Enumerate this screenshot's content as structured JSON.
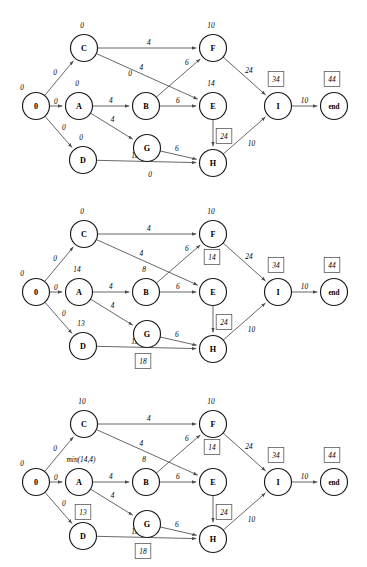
{
  "figure": {
    "kind": "graph-diagram-sequence",
    "panel_count": 3,
    "node_radius": 13.5,
    "node_positions": {
      "S": {
        "x": 36,
        "y": 106
      },
      "A": {
        "x": 79,
        "y": 106
      },
      "B": {
        "x": 146,
        "y": 106
      },
      "C": {
        "x": 84,
        "y": 48
      },
      "D": {
        "x": 83,
        "y": 160
      },
      "E": {
        "x": 213,
        "y": 106
      },
      "F": {
        "x": 213,
        "y": 48
      },
      "G": {
        "x": 147,
        "y": 148
      },
      "H": {
        "x": 213,
        "y": 163
      },
      "I": {
        "x": 278,
        "y": 106
      },
      "end": {
        "x": 334,
        "y": 106
      }
    },
    "edges": [
      {
        "from": "S",
        "to": "C"
      },
      {
        "from": "S",
        "to": "A"
      },
      {
        "from": "S",
        "to": "D"
      },
      {
        "from": "C",
        "to": "F"
      },
      {
        "from": "C",
        "to": "E"
      },
      {
        "from": "A",
        "to": "B"
      },
      {
        "from": "A",
        "to": "G"
      },
      {
        "from": "B",
        "to": "E"
      },
      {
        "from": "B",
        "to": "F"
      },
      {
        "from": "D",
        "to": "H"
      },
      {
        "from": "G",
        "to": "H"
      },
      {
        "from": "E",
        "to": "H"
      },
      {
        "from": "F",
        "to": "I"
      },
      {
        "from": "H",
        "to": "I"
      },
      {
        "from": "I",
        "to": "end"
      }
    ],
    "node_labels": {
      "S": "0",
      "A": "A",
      "B": "B",
      "C": "C",
      "D": "D",
      "E": "E",
      "F": "F",
      "G": "G",
      "H": "H",
      "I": "I",
      "end": "end"
    },
    "edge_weights": {
      "S-C": "0",
      "S-A": "0",
      "S-D": "0",
      "C-F": "4",
      "C-E": "4",
      "A-B": "4",
      "A-G": "4",
      "B-E": "6",
      "B-F": "6",
      "D-H": "11",
      "G-H": "6",
      "E-H": "10",
      "F-I": "24",
      "H-I": "10",
      "I-end": "10"
    }
  },
  "panels": [
    {
      "id": "panel-1",
      "name": "diagram-1",
      "node_values": [
        {
          "node": "S",
          "text": "0",
          "boxed": false,
          "dx": -14,
          "dy": -19
        },
        {
          "node": "C",
          "text": "0",
          "boxed": false,
          "dx": -2,
          "dy": -23
        },
        {
          "node": "A",
          "text": "0",
          "boxed": false,
          "dx": -2,
          "dy": -23
        },
        {
          "node": "D",
          "text": "0",
          "boxed": false,
          "dx": -2,
          "dy": -23
        },
        {
          "node": "F",
          "text": "10",
          "boxed": false,
          "dx": -2,
          "dy": -23
        },
        {
          "node": "E",
          "text": "14",
          "boxed": false,
          "dx": -2,
          "dy": -23
        },
        {
          "node": "I",
          "text": "34",
          "boxed": true,
          "dx": -2,
          "dy": -27
        },
        {
          "node": "end",
          "text": "44",
          "boxed": true,
          "dx": -2,
          "dy": -27
        }
      ],
      "extra_labels": [
        {
          "name": "label-c-e-zero",
          "text": "0",
          "x": 130,
          "y": 73,
          "boxed": false
        },
        {
          "name": "label-d-h-zero",
          "text": "0",
          "x": 150,
          "y": 174,
          "boxed": false
        },
        {
          "name": "label-e-h-boxed",
          "text": "24",
          "x": 224,
          "y": 136,
          "boxed": true
        }
      ]
    },
    {
      "id": "panel-2",
      "name": "diagram-2",
      "node_values": [
        {
          "node": "S",
          "text": "0",
          "boxed": false,
          "dx": -14,
          "dy": -19
        },
        {
          "node": "C",
          "text": "0",
          "boxed": false,
          "dx": -2,
          "dy": -23
        },
        {
          "node": "A",
          "text": "14",
          "boxed": false,
          "dx": -2,
          "dy": -23
        },
        {
          "node": "B",
          "text": "8",
          "boxed": false,
          "dx": -2,
          "dy": -23
        },
        {
          "node": "D",
          "text": "13",
          "boxed": false,
          "dx": -2,
          "dy": -23
        },
        {
          "node": "F",
          "text": "10",
          "boxed": false,
          "dx": -2,
          "dy": -23
        },
        {
          "node": "I",
          "text": "34",
          "boxed": true,
          "dx": -2,
          "dy": -27
        },
        {
          "node": "end",
          "text": "44",
          "boxed": true,
          "dx": -2,
          "dy": -27
        }
      ],
      "extra_labels": [
        {
          "name": "label-f-e-boxed",
          "text": "14",
          "x": 212,
          "y": 71,
          "boxed": true
        },
        {
          "name": "label-d-h-boxed",
          "text": "18",
          "x": 143,
          "y": 175,
          "boxed": true
        },
        {
          "name": "label-e-h-boxed",
          "text": "24",
          "x": 224,
          "y": 136,
          "boxed": true
        }
      ]
    },
    {
      "id": "panel-3",
      "name": "diagram-3",
      "node_values": [
        {
          "node": "S",
          "text": "0",
          "boxed": false,
          "dx": -14,
          "dy": -19
        },
        {
          "node": "C",
          "text": "10",
          "boxed": false,
          "dx": -2,
          "dy": -23
        },
        {
          "node": "A",
          "text": "min(14,4)",
          "boxed": false,
          "dx": 2,
          "dy": -23
        },
        {
          "node": "B",
          "text": "8",
          "boxed": false,
          "dx": -2,
          "dy": -23
        },
        {
          "node": "F",
          "text": "10",
          "boxed": false,
          "dx": -2,
          "dy": -23
        },
        {
          "node": "I",
          "text": "34",
          "boxed": true,
          "dx": -2,
          "dy": -27
        },
        {
          "node": "end",
          "text": "44",
          "boxed": true,
          "dx": -2,
          "dy": -27
        }
      ],
      "extra_labels": [
        {
          "name": "label-f-e-boxed",
          "text": "14",
          "x": 212,
          "y": 71,
          "boxed": true
        },
        {
          "name": "label-d-boxed",
          "text": "13",
          "x": 83,
          "y": 136,
          "boxed": true
        },
        {
          "name": "label-d-h-boxed",
          "text": "18",
          "x": 143,
          "y": 175,
          "boxed": true
        },
        {
          "name": "label-e-h-boxed",
          "text": "24",
          "x": 224,
          "y": 136,
          "boxed": true
        }
      ]
    }
  ],
  "colors": {
    "node_stroke": "#1a1a1a",
    "edge_stroke": "#4d4d4d",
    "box_stroke": "#5a5a5a",
    "background": "#ffffff",
    "text": "#000000"
  }
}
